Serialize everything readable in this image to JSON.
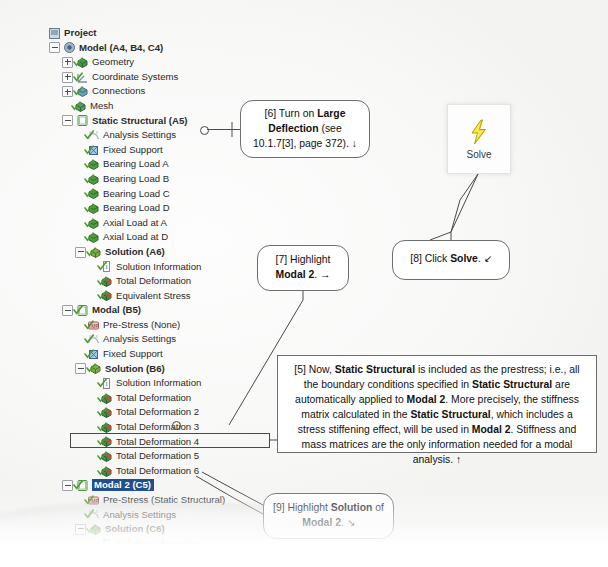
{
  "app": {
    "title": "ANSYS Workbench Mechanical outline tree"
  },
  "tree": {
    "nodes": [
      {
        "label": "Project",
        "indent": 0,
        "expander": "none",
        "icon": "project-icon",
        "bold": true,
        "check": false,
        "selected": false
      },
      {
        "label": "Model (A4, B4, C4)",
        "indent": 1,
        "expander": "minus",
        "icon": "model-icon",
        "bold": true,
        "check": false,
        "selected": false
      },
      {
        "label": "Geometry",
        "indent": 2,
        "expander": "plus",
        "icon": "geometry-icon",
        "bold": false,
        "check": true,
        "selected": false
      },
      {
        "label": "Coordinate Systems",
        "indent": 2,
        "expander": "plus",
        "icon": "coordinate-systems-icon",
        "bold": false,
        "check": true,
        "selected": false
      },
      {
        "label": "Connections",
        "indent": 2,
        "expander": "plus",
        "icon": "connections-icon",
        "bold": false,
        "check": true,
        "selected": false
      },
      {
        "label": "Mesh",
        "indent": 2,
        "expander": "none",
        "icon": "mesh-icon",
        "bold": false,
        "check": true,
        "selected": false
      },
      {
        "label": "Static Structural (A5)",
        "indent": 2,
        "expander": "minus",
        "icon": "environment-icon",
        "bold": true,
        "check": false,
        "selected": false
      },
      {
        "label": "Analysis Settings",
        "indent": 3,
        "expander": "none",
        "icon": "analysis-settings-icon",
        "bold": false,
        "check": true,
        "selected": false
      },
      {
        "label": "Fixed Support",
        "indent": 3,
        "expander": "none",
        "icon": "support-icon",
        "bold": false,
        "check": true,
        "selected": false
      },
      {
        "label": "Bearing Load A",
        "indent": 3,
        "expander": "none",
        "icon": "load-icon",
        "bold": false,
        "check": true,
        "selected": false
      },
      {
        "label": "Bearing Load B",
        "indent": 3,
        "expander": "none",
        "icon": "load-icon",
        "bold": false,
        "check": true,
        "selected": false
      },
      {
        "label": "Bearing Load C",
        "indent": 3,
        "expander": "none",
        "icon": "load-icon",
        "bold": false,
        "check": true,
        "selected": false
      },
      {
        "label": "Bearing Load D",
        "indent": 3,
        "expander": "none",
        "icon": "load-icon",
        "bold": false,
        "check": true,
        "selected": false
      },
      {
        "label": "Axial Load at A",
        "indent": 3,
        "expander": "none",
        "icon": "load-icon",
        "bold": false,
        "check": true,
        "selected": false
      },
      {
        "label": "Axial Load at D",
        "indent": 3,
        "expander": "none",
        "icon": "load-icon",
        "bold": false,
        "check": true,
        "selected": false
      },
      {
        "label": "Solution (A6)",
        "indent": 3,
        "expander": "minus",
        "icon": "solution-icon",
        "bold": true,
        "check": true,
        "selected": false
      },
      {
        "label": "Solution Information",
        "indent": 4,
        "expander": "none",
        "icon": "solution-information-icon",
        "bold": false,
        "check": true,
        "selected": false
      },
      {
        "label": "Total Deformation",
        "indent": 4,
        "expander": "none",
        "icon": "result-icon",
        "bold": false,
        "check": true,
        "selected": false
      },
      {
        "label": "Equivalent Stress",
        "indent": 4,
        "expander": "none",
        "icon": "result-icon",
        "bold": false,
        "check": true,
        "selected": false
      },
      {
        "label": "Modal (B5)",
        "indent": 2,
        "expander": "minus",
        "icon": "environment-icon",
        "bold": true,
        "check": true,
        "selected": false
      },
      {
        "label": "Pre-Stress (None)",
        "indent": 3,
        "expander": "none",
        "icon": "prestress-icon",
        "bold": false,
        "check": true,
        "selected": false
      },
      {
        "label": "Analysis Settings",
        "indent": 3,
        "expander": "none",
        "icon": "analysis-settings-icon",
        "bold": false,
        "check": true,
        "selected": false
      },
      {
        "label": "Fixed Support",
        "indent": 3,
        "expander": "none",
        "icon": "support-icon",
        "bold": false,
        "check": true,
        "selected": false
      },
      {
        "label": "Solution (B6)",
        "indent": 3,
        "expander": "minus",
        "icon": "solution-icon",
        "bold": true,
        "check": true,
        "selected": false
      },
      {
        "label": "Solution Information",
        "indent": 4,
        "expander": "none",
        "icon": "solution-information-icon",
        "bold": false,
        "check": true,
        "selected": false
      },
      {
        "label": "Total Deformation",
        "indent": 4,
        "expander": "none",
        "icon": "result-icon",
        "bold": false,
        "check": true,
        "selected": false
      },
      {
        "label": "Total Deformation 2",
        "indent": 4,
        "expander": "none",
        "icon": "result-icon",
        "bold": false,
        "check": true,
        "selected": false
      },
      {
        "label": "Total Deformation 3",
        "indent": 4,
        "expander": "none",
        "icon": "result-icon",
        "bold": false,
        "check": true,
        "selected": false
      },
      {
        "label": "Total Deformation 4",
        "indent": 4,
        "expander": "none",
        "icon": "result-icon",
        "bold": false,
        "check": true,
        "selected": false
      },
      {
        "label": "Total Deformation 5",
        "indent": 4,
        "expander": "none",
        "icon": "result-icon",
        "bold": false,
        "check": true,
        "selected": false
      },
      {
        "label": "Total Deformation 6",
        "indent": 4,
        "expander": "none",
        "icon": "result-icon",
        "bold": false,
        "check": true,
        "selected": false
      },
      {
        "label": "Modal 2 (C5)",
        "indent": 2,
        "expander": "minus",
        "icon": "environment-icon",
        "bold": true,
        "check": true,
        "selected": true
      },
      {
        "label": "Pre-Stress (Static Structural)",
        "indent": 3,
        "expander": "none",
        "icon": "prestress-icon",
        "bold": false,
        "check": true,
        "selected": false
      },
      {
        "label": "Analysis Settings",
        "indent": 3,
        "expander": "none",
        "icon": "analysis-settings-icon",
        "bold": false,
        "check": true,
        "selected": false
      },
      {
        "label": "Solution (C6)",
        "indent": 3,
        "expander": "minus",
        "icon": "solution-icon",
        "bold": true,
        "check": true,
        "selected": false
      },
      {
        "label": "Solution Information",
        "indent": 4,
        "expander": "none",
        "icon": "solution-information-icon",
        "bold": false,
        "check": true,
        "selected": false
      }
    ]
  },
  "solve_button": {
    "label": "Solve",
    "icon": "lightning-bolt-icon",
    "icon_color": "#f2d21a"
  },
  "callouts": {
    "six": {
      "name": "callout-6",
      "segments": [
        {
          "text": "[6] Turn on ",
          "bold": false
        },
        {
          "text": "Large Deflection",
          "bold": true
        },
        {
          "text": " (see 10.1.7[3], page 372). ↓",
          "bold": false
        }
      ]
    },
    "seven": {
      "name": "callout-7",
      "segments": [
        {
          "text": "[7] Highlight ",
          "bold": false
        },
        {
          "text": "Modal 2",
          "bold": true
        },
        {
          "text": ". →",
          "bold": false
        }
      ]
    },
    "eight": {
      "name": "callout-8",
      "segments": [
        {
          "text": "[8] Click ",
          "bold": false
        },
        {
          "text": "Solve",
          "bold": true
        },
        {
          "text": ". ↙",
          "bold": false
        }
      ]
    },
    "nine": {
      "name": "callout-9",
      "segments": [
        {
          "text": "[9] Highlight ",
          "bold": false
        },
        {
          "text": "Solution",
          "bold": true
        },
        {
          "text": " of ",
          "bold": false
        },
        {
          "text": "Modal 2",
          "bold": true
        },
        {
          "text": ". ↘",
          "bold": false
        }
      ]
    },
    "five": {
      "name": "callout-5",
      "segments": [
        {
          "text": "[5] Now, ",
          "bold": false
        },
        {
          "text": "Static Structural",
          "bold": true
        },
        {
          "text": " is included as the prestress; i.e., all the boundary conditions specified in ",
          "bold": false
        },
        {
          "text": "Static Structural",
          "bold": true
        },
        {
          "text": " are automatically applied to ",
          "bold": false
        },
        {
          "text": "Modal 2",
          "bold": true
        },
        {
          "text": ". More precisely, the stiffness matrix calculated in the ",
          "bold": false
        },
        {
          "text": "Static Structural",
          "bold": true
        },
        {
          "text": ", which includes a stress stiffening effect, will be used in ",
          "bold": false
        },
        {
          "text": "Modal 2",
          "bold": true
        },
        {
          "text": ". Stiffness and mass matrices are the only information needed for a modal analysis. ↑",
          "bold": false
        }
      ]
    }
  },
  "colors": {
    "selection": "#1f4f8f",
    "check_green": "#4f9b2f",
    "icon_green": "#2e8b35",
    "callout_border": "#6e6e6e",
    "page": "#f8f8f7"
  }
}
